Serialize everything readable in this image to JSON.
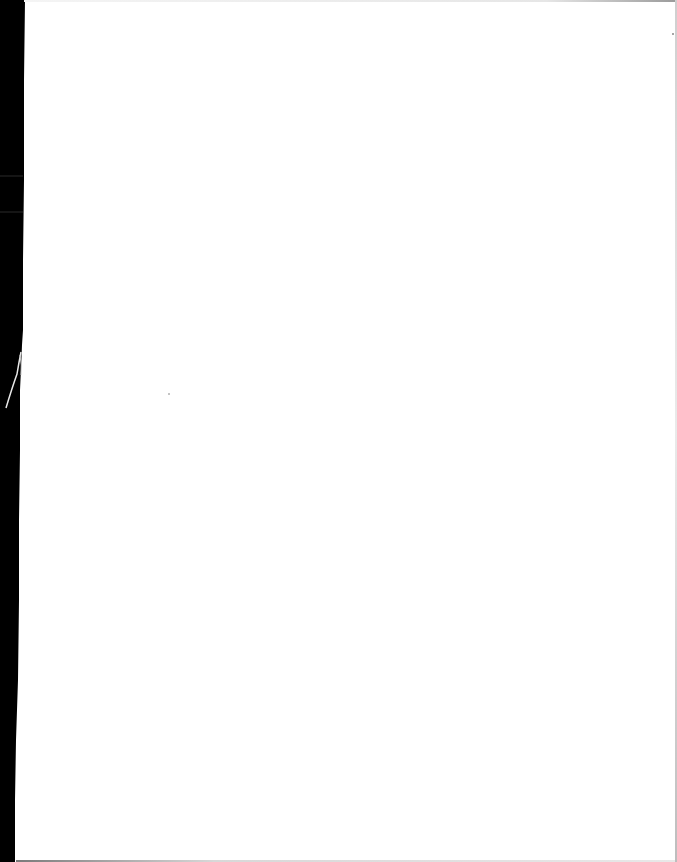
{
  "document": {
    "type": "scanned-page",
    "content": "",
    "colors": {
      "paper": "#ffffff",
      "scan_border": "#000000"
    }
  }
}
